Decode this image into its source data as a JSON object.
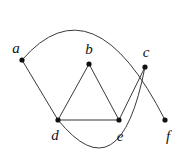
{
  "figure": {
    "width": 184,
    "height": 157,
    "background_color": "#ffffff"
  },
  "style": {
    "edge_color": "#3a3a3a",
    "edge_highlight_color": "#9a9a9a",
    "vertex_color": "#111111",
    "label_color": "#111111",
    "edge_width": 1,
    "edge_highlight_width": 2,
    "vertex_radius": 2.6
  },
  "chart_data": {
    "type": "diagram",
    "subtype": "node-link-graph",
    "directed": false,
    "nodes": [
      {
        "id": "a",
        "label": "a",
        "x": 22,
        "y": 60,
        "label_x": 16,
        "label_y": 48
      },
      {
        "id": "b",
        "label": "b",
        "x": 89,
        "y": 64,
        "label_x": 89,
        "label_y": 49
      },
      {
        "id": "c",
        "label": "c",
        "x": 145,
        "y": 67,
        "label_x": 146,
        "label_y": 52
      },
      {
        "id": "d",
        "label": "d",
        "x": 58,
        "y": 120,
        "label_x": 55,
        "label_y": 135
      },
      {
        "id": "e",
        "label": "e",
        "x": 119,
        "y": 120,
        "label_x": 120,
        "label_y": 136
      },
      {
        "id": "f",
        "label": "f",
        "x": 165,
        "y": 120,
        "label_x": 168,
        "label_y": 136
      }
    ],
    "edges": [
      {
        "source": "a",
        "target": "d",
        "shape": "straight",
        "highlighted": false
      },
      {
        "source": "b",
        "target": "d",
        "shape": "straight",
        "highlighted": false
      },
      {
        "source": "b",
        "target": "e",
        "shape": "straight",
        "highlighted": false
      },
      {
        "source": "c",
        "target": "e",
        "shape": "straight",
        "highlighted": false
      },
      {
        "source": "d",
        "target": "e",
        "shape": "straight",
        "highlighted": true
      },
      {
        "source": "a",
        "target": "f",
        "shape": "curved",
        "highlighted": false,
        "control": [
          93,
          -22
        ]
      },
      {
        "source": "c",
        "target": "d",
        "shape": "curved",
        "highlighted": false,
        "control": [
          120,
          196
        ]
      }
    ]
  }
}
